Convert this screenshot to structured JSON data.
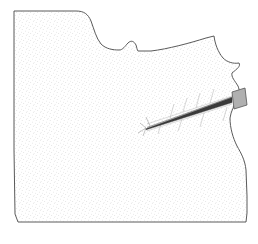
{
  "figure": {
    "kind": "technical-line-drawing",
    "caption": "",
    "canvas": {
      "width": 258,
      "height": 244,
      "background": "#ffffff"
    },
    "style": {
      "outline_color": "#5a5a5a",
      "outline_width": 1,
      "stipple_color": "#bdbdbd",
      "stipple_background": "#ffffff",
      "shaft_color": "#3a3a3a",
      "head_fill": "#b0b0b0",
      "head_stroke": "#555555",
      "tick_color": "#b5b5b5"
    },
    "parts": [
      {
        "name": "matrix-body",
        "label": "Stippled matrix mass",
        "description": "Large irregular stipple-filled block occupying most of the frame",
        "outline_points": "14,11 76,11 88,13 96,22 100,34 104,42 113,48 122,50 126,45 131,41 136,45 138,51 150,51 182,45 206,38 213,36 216,44 220,53 225,60 232,63 238,62 241,66 236,70 231,74 233,80 238,85 240,92 237,99 233,106 231,116 233,127 236,138 240,146 244,152 246,162 247,176 247,196 247,212 246,222 120,222 18,222 15,212 14,150 14,80 14,11"
      },
      {
        "name": "artifact-shaft",
        "label": "Embedded linear artifact shaft",
        "description": "Long slender tapering shaft running from lower-left point up to right margin",
        "tip": {
          "x": 146,
          "y": 128
        },
        "base": {
          "x": 233,
          "y": 100
        }
      },
      {
        "name": "artifact-head",
        "label": "Artifact head / cap",
        "description": "Small gray parallelogram cap straddling the right outline",
        "center": {
          "x": 239,
          "y": 99
        },
        "fill": "#b0b0b0"
      },
      {
        "name": "top-notch",
        "label": "Stepped notch on upper edge",
        "description": "Curved drop followed by small bump and a step down"
      },
      {
        "name": "right-zigzag",
        "label": "Angular zigzag on right edge",
        "description": "Jagged re-entrant on the upper right margin"
      },
      {
        "name": "bottom-right-concavity",
        "label": "Concave sweep at lower right",
        "description": "Inward curving edge meeting the flat bottom"
      }
    ],
    "tick_marks": [
      {
        "x1": 170,
        "y1": 118,
        "x2": 174,
        "y2": 104
      },
      {
        "x1": 183,
        "y1": 112,
        "x2": 187,
        "y2": 98
      },
      {
        "x1": 196,
        "y1": 108,
        "x2": 200,
        "y2": 93
      },
      {
        "x1": 210,
        "y1": 103,
        "x2": 214,
        "y2": 89
      },
      {
        "x1": 223,
        "y1": 121,
        "x2": 227,
        "y2": 107
      },
      {
        "x1": 200,
        "y1": 127,
        "x2": 204,
        "y2": 113
      },
      {
        "x1": 178,
        "y1": 131,
        "x2": 182,
        "y2": 119
      },
      {
        "x1": 158,
        "y1": 134,
        "x2": 161,
        "y2": 124
      }
    ],
    "tip_rays": [
      {
        "x1": 146,
        "y1": 128,
        "x2": 138,
        "y2": 133
      },
      {
        "x1": 146,
        "y1": 128,
        "x2": 140,
        "y2": 123
      },
      {
        "x1": 146,
        "y1": 128,
        "x2": 143,
        "y2": 136
      },
      {
        "x1": 150,
        "y1": 126,
        "x2": 146,
        "y2": 117
      }
    ]
  }
}
